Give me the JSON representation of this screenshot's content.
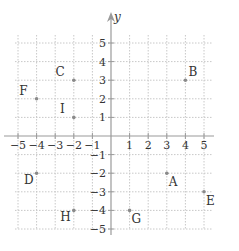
{
  "chart_data": {
    "type": "scatter",
    "title": "",
    "xlabel": "",
    "ylabel": "y",
    "xlim": [
      -5,
      5
    ],
    "ylim": [
      -5,
      5
    ],
    "grid": true,
    "legend": null,
    "x_ticks": [
      -5,
      -4,
      -3,
      -2,
      -1,
      1,
      2,
      3,
      4,
      5
    ],
    "y_ticks": [
      5,
      4,
      3,
      2,
      1,
      -1,
      -2,
      -3,
      -4,
      -5
    ],
    "x_tick_labels": [
      "−5",
      "−4",
      "−3",
      "−2",
      "−1",
      "1",
      "2",
      "3",
      "4",
      "5"
    ],
    "y_tick_labels": [
      "5",
      "4",
      "3",
      "2",
      "1",
      "−1",
      "−2",
      "−3",
      "−4",
      "−5"
    ],
    "points": [
      {
        "label": "A",
        "x": 3,
        "y": -2,
        "label_pos": "below-right"
      },
      {
        "label": "B",
        "x": 4,
        "y": 3,
        "label_pos": "above-right"
      },
      {
        "label": "C",
        "x": -2,
        "y": 3,
        "label_pos": "above-left"
      },
      {
        "label": "D",
        "x": -4,
        "y": -2,
        "label_pos": "below-left"
      },
      {
        "label": "E",
        "x": 5,
        "y": -3,
        "label_pos": "below-right"
      },
      {
        "label": "F",
        "x": -4,
        "y": 2,
        "label_pos": "above-left"
      },
      {
        "label": "G",
        "x": 1,
        "y": -4,
        "label_pos": "below-right"
      },
      {
        "label": "H",
        "x": -2,
        "y": -4,
        "label_pos": "below-left"
      },
      {
        "label": "I",
        "x": -2,
        "y": 1,
        "label_pos": "above-left"
      }
    ]
  },
  "colors": {
    "axis": "#9a9a9a",
    "grid": "#c8c8c8",
    "point": "#8a8a8a",
    "text": "#333333"
  }
}
